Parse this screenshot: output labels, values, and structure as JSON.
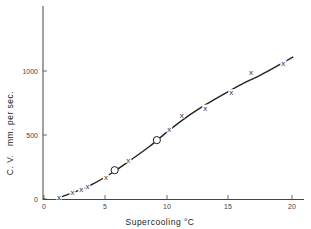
{
  "chart_data": {
    "type": "line",
    "title": "",
    "xlabel": "Supercooling °C",
    "ylabel": "C. V.   mm. per sec.",
    "xlim": [
      0,
      21
    ],
    "ylim": [
      0,
      1450
    ],
    "xticks": [
      0,
      5,
      10,
      15,
      20
    ],
    "yticks": [
      0,
      500,
      1000
    ],
    "grid": false,
    "legend": null,
    "series": [
      {
        "name": "measured (x)",
        "marker": "x",
        "x": [
          1.2,
          2.3,
          3.0,
          3.5,
          5.0,
          6.8,
          10.1,
          11.1,
          13.0,
          15.1,
          16.7,
          19.3
        ],
        "y": [
          15,
          50,
          75,
          95,
          165,
          300,
          540,
          650,
          710,
          830,
          990,
          1060
        ]
      },
      {
        "name": "measured (o)",
        "marker": "o",
        "x": [
          5.7,
          9.1
        ],
        "y": [
          225,
          460
        ]
      },
      {
        "name": "fitted curve",
        "marker": "none",
        "x": [
          1.2,
          2.5,
          4.0,
          5.5,
          7.0,
          8.5,
          10.0,
          11.5,
          13.0,
          14.5,
          16.0,
          17.5,
          19.0,
          20.1
        ],
        "y": [
          10,
          55,
          120,
          205,
          305,
          410,
          530,
          640,
          735,
          820,
          900,
          970,
          1050,
          1110
        ]
      }
    ]
  }
}
